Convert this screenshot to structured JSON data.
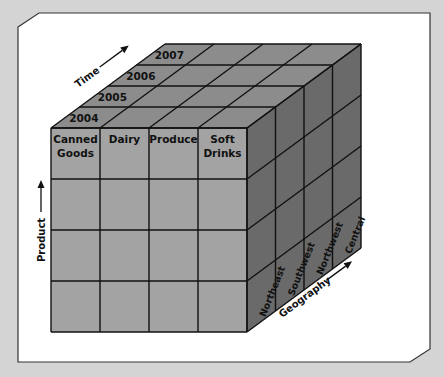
{
  "diagram": {
    "type": "olap-data-cube",
    "colors": {
      "background": "#d4d4d4",
      "frame": "#ffffff",
      "front_face": "#a3a3a3",
      "top_face": "#8c8c8c",
      "side_face": "#6a6a6a",
      "lines": "#111111"
    },
    "axes": {
      "time": {
        "label": "Time",
        "values": [
          "2004",
          "2005",
          "2006",
          "2007"
        ]
      },
      "product": {
        "label": "Product",
        "values": [
          {
            "line1": "Canned",
            "line2": "Goods"
          },
          {
            "line1": "Dairy",
            "line2": ""
          },
          {
            "line1": "Produce",
            "line2": ""
          },
          {
            "line1": "Soft",
            "line2": "Drinks"
          }
        ]
      },
      "geography": {
        "label": "Geography",
        "values": [
          "Northeast",
          "Southwest",
          "Northwest",
          "Central"
        ]
      }
    }
  }
}
